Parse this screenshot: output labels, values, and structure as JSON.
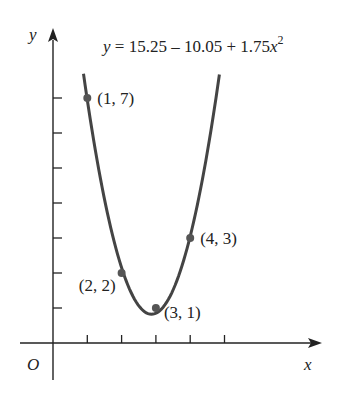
{
  "chart_data": {
    "type": "scatter",
    "equation_text": "y = 15.25 – 10.05 + 1.75x",
    "equation_exponent": "2",
    "xlabel": "x",
    "ylabel": "y",
    "origin_label": "O",
    "x_ticks": [
      1,
      2,
      3,
      4,
      5
    ],
    "y_ticks": [
      1,
      2,
      3,
      4,
      5,
      6,
      7
    ],
    "xlim": [
      0,
      7.8
    ],
    "ylim": [
      0,
      8.6
    ],
    "grid": false,
    "tick_labels_shown": false,
    "points": [
      {
        "x": 1,
        "y": 7,
        "label": "(1, 7)"
      },
      {
        "x": 2,
        "y": 2,
        "label": "(2, 2)"
      },
      {
        "x": 3,
        "y": 1,
        "label": "(3, 1)"
      },
      {
        "x": 4,
        "y": 3,
        "label": "(4, 3)"
      }
    ],
    "curve": {
      "type": "quadratic",
      "a": 1.75,
      "b": -10.05,
      "c": 15.25,
      "x_range": [
        0.89,
        4.85
      ]
    },
    "colors": {
      "axis": "#222222",
      "curve": "#444444",
      "point": "#555555"
    }
  }
}
